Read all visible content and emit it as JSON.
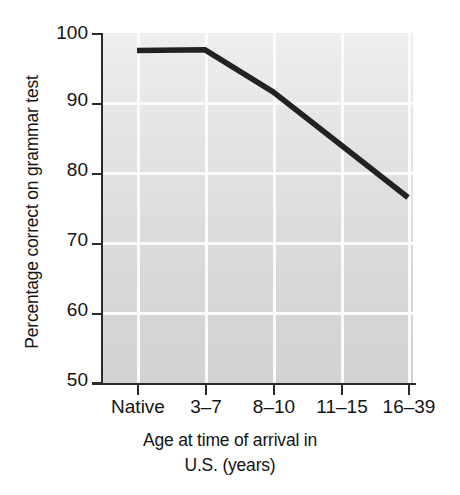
{
  "chart_data": {
    "type": "line",
    "title": "",
    "subtitle": "",
    "xlabel_line1": "Age at time of arrival in",
    "xlabel_line2": "U.S. (years)",
    "xlabel": "Age at time of arrival in U.S. (years)",
    "ylabel": "Percentage correct on grammar test",
    "categories": [
      "Native",
      "3–7",
      "8–10",
      "11–15",
      "16–39"
    ],
    "values": [
      97.5,
      97.6,
      91.6,
      84.0,
      76.5
    ],
    "series": [
      {
        "name": "Percentage correct on grammar test",
        "values": [
          97.5,
          97.6,
          91.6,
          84.0,
          76.5
        ]
      }
    ],
    "ylim": [
      50,
      100
    ],
    "yticks": [
      100,
      90,
      80,
      70,
      60,
      50
    ],
    "ytick_labels": [
      "100",
      "90",
      "80",
      "70",
      "60",
      "50"
    ],
    "xtick_labels": [
      "Native",
      "3–7",
      "8–10",
      "11–15",
      "16–39"
    ],
    "grid": true,
    "grid_color": "#fbfbfb",
    "legend": false,
    "legend_position": "none",
    "line_color": "#222222",
    "line_width": 5,
    "plot_background_top": "#eeeeee",
    "plot_background_bottom": "#d2d2d2",
    "axis_color": "#2b2b2b",
    "text_color": "#141414"
  }
}
